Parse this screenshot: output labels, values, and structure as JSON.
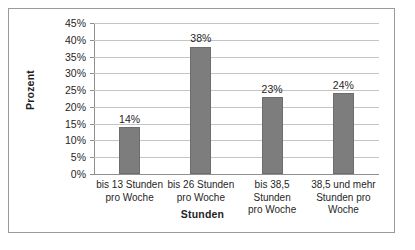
{
  "chart_data": {
    "type": "bar",
    "title": "",
    "xlabel": "Stunden",
    "ylabel": "Prozent",
    "categories": [
      "bis 13 Stunden\npro Woche",
      "bis 26 Stunden\npro Woche",
      "bis 38,5 Stunden\npro Woche",
      "38,5 und mehr\nStunden pro\nWoche"
    ],
    "values": [
      14,
      38,
      23,
      24
    ],
    "value_labels": [
      "14%",
      "38%",
      "23%",
      "24%"
    ],
    "ylim": [
      0,
      45
    ],
    "ytick_values": [
      45,
      40,
      35,
      30,
      25,
      20,
      15,
      10,
      5,
      0
    ],
    "ytick_labels": [
      "45%",
      "40%",
      "35%",
      "30%",
      "25%",
      "20%",
      "15%",
      "10%",
      "5%",
      "0%"
    ],
    "grid": true,
    "legend": false,
    "bar_color": "#7d7d7d",
    "gridline_color": "#c4c4c4",
    "axis_color": "#8f8f8f",
    "border_color": "#9a9a9a",
    "text_color": "#1f1f1f"
  }
}
